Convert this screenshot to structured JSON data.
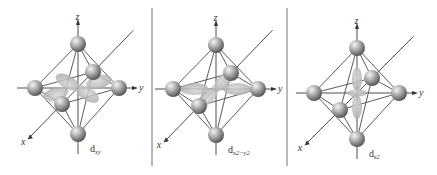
{
  "figure": {
    "panels": [
      {
        "id": "dxy",
        "orbital_label_base": "d",
        "orbital_label_sub": "xy",
        "axis_labels": {
          "x": "x",
          "y": "y",
          "z": "z"
        }
      },
      {
        "id": "dx2-y2",
        "orbital_label_base": "d",
        "orbital_label_sub": "x2−y2",
        "axis_labels": {
          "x": "x",
          "y": "y",
          "z": "z"
        }
      },
      {
        "id": "dz2",
        "orbital_label_base": "d",
        "orbital_label_sub": "z2",
        "axis_labels": {
          "x": "x",
          "y": "y",
          "z": "z"
        }
      }
    ],
    "colors": {
      "ligand": "#8c8c8c",
      "ligand_highlight": "#f2f2f2",
      "orbital_lobe": "#b8b8b8",
      "edge": "#4a4a4a",
      "divider": "#8a8a8a"
    }
  }
}
